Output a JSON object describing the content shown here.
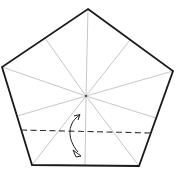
{
  "diagram": {
    "type": "origami-fold-step",
    "shape": "pentagon",
    "colors": {
      "outline": "#1a1a1a",
      "crease": "#9a9a9a",
      "fold_line": "#333333",
      "arrow": "#222222",
      "background": "#ffffff"
    },
    "creases": 10,
    "fold": "valley fold along dashed line, fold bottom up"
  }
}
